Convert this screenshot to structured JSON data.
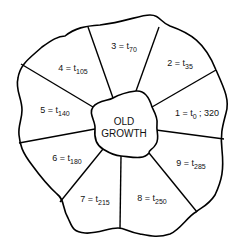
{
  "diagram": {
    "type": "rotation-stand-wheel",
    "center": {
      "line1": "OLD",
      "line2": "GROWTH"
    },
    "stands": [
      {
        "id": 1,
        "prefix": "1 = t",
        "sub": "0",
        "suffix": " ; 320"
      },
      {
        "id": 2,
        "prefix": "2 = t",
        "sub": "35",
        "suffix": ""
      },
      {
        "id": 3,
        "prefix": "3 = t",
        "sub": "70",
        "suffix": ""
      },
      {
        "id": 4,
        "prefix": "4 = t",
        "sub": "105",
        "suffix": ""
      },
      {
        "id": 5,
        "prefix": "5 = t",
        "sub": "140",
        "suffix": ""
      },
      {
        "id": 6,
        "prefix": "6 = t",
        "sub": "180",
        "suffix": ""
      },
      {
        "id": 7,
        "prefix": "7 = t",
        "sub": "215",
        "suffix": ""
      },
      {
        "id": 8,
        "prefix": "8 = t",
        "sub": "250",
        "suffix": ""
      },
      {
        "id": 9,
        "prefix": "9 = t",
        "sub": "285",
        "suffix": ""
      }
    ]
  }
}
